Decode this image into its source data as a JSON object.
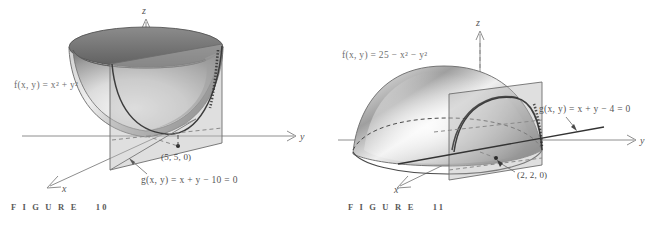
{
  "page": {
    "background_color": "#ffffff",
    "width": 668,
    "height": 226
  },
  "figures": [
    {
      "id": "figure-10",
      "caption": "F I G U R E    10",
      "caption_word": "FIGURE",
      "caption_number": "10",
      "surface_label": "f(x, y)  =  x²  +  y²",
      "constraint_label": "g(x, y)  =  x  +  y  −  10  =  0",
      "point_label": "(5, 5, 0)",
      "axes": {
        "x": "x",
        "y": "y",
        "z": "z"
      },
      "surface_type": "upward paraboloid bowl",
      "colors": {
        "surface_light": "#f2f2f2",
        "surface_mid": "#a9a9a9",
        "surface_dark": "#6f6f6f",
        "plane": "#b9b9b9",
        "axis": "#8e8e8e",
        "label": "#6e6e6e"
      }
    },
    {
      "id": "figure-11",
      "caption": "F I G U R E    11",
      "caption_word": "FIGURE",
      "caption_number": "11",
      "surface_label": "f(x, y)  =  25  −  x²  −  y²",
      "constraint_label": "g(x, y)  =  x  +  y  −  4  =  0",
      "point_label": "(2, 2, 0)",
      "axes": {
        "x": "x",
        "y": "y",
        "z": "z"
      },
      "surface_type": "downward paraboloid dome",
      "colors": {
        "surface_light": "#f2f2f2",
        "surface_mid": "#a9a9a9",
        "surface_dark": "#6f6f6f",
        "plane": "#b9b9b9",
        "axis": "#8e8e8e",
        "label": "#6e6e6e"
      }
    }
  ]
}
